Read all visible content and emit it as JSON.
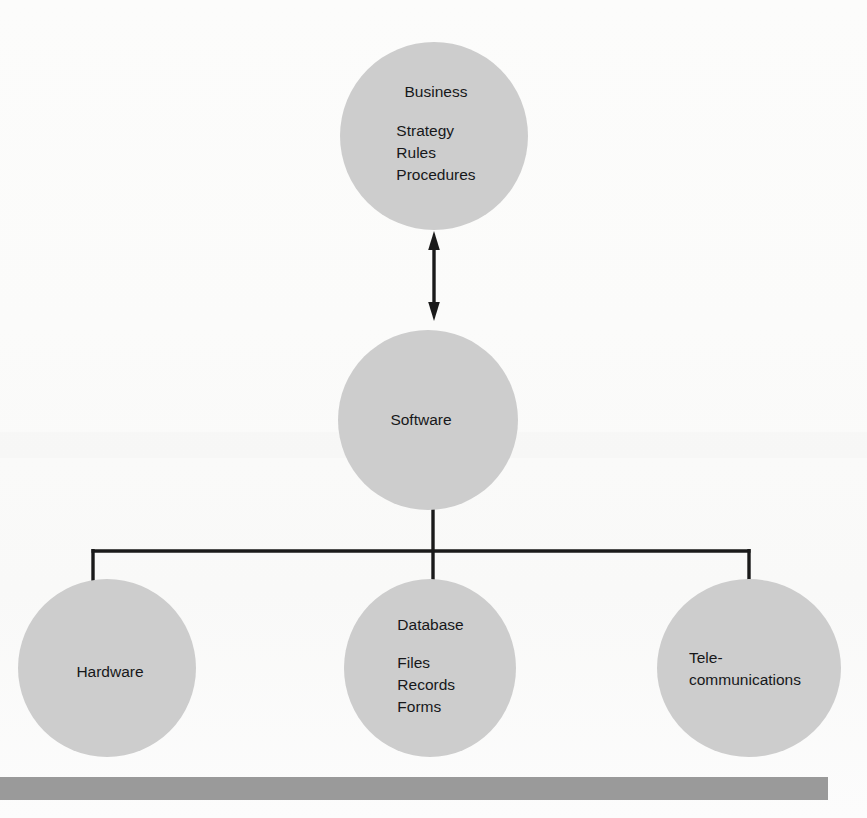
{
  "diagram": {
    "type": "hierarchy",
    "background_color": "#fdfdfd",
    "node_fill_color": "#cdcdcd",
    "line_color": "#1a1a1a",
    "baseline_bar_color": "#9a9a9a",
    "nodes": {
      "business": {
        "heading": "Business",
        "items": [
          "Strategy",
          "Rules",
          "Procedures"
        ]
      },
      "software": {
        "heading": "Software"
      },
      "hardware": {
        "heading": "Hardware"
      },
      "database": {
        "heading": "Database",
        "items": [
          "Files",
          "Records",
          "Forms"
        ]
      },
      "telecommunications": {
        "line1": "Tele-",
        "line2": "communications"
      }
    },
    "connectors": {
      "business_software": "double-headed-vertical-arrow",
      "software_children": "tree-bracket"
    }
  }
}
